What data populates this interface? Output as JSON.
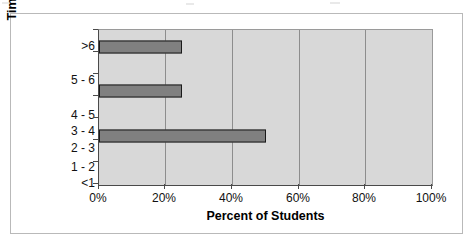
{
  "chart_data": {
    "type": "bar",
    "orientation": "horizontal",
    "title": "",
    "xlabel": "Percent of Students",
    "ylabel": "Time to Perform (hrs)",
    "categories": [
      "<1",
      "1 - 2",
      "2 - 3",
      "3 - 4",
      "4 - 5",
      "5 - 6",
      ">6"
    ],
    "values": [
      0,
      0,
      50,
      0,
      25,
      0,
      25
    ],
    "xlim": [
      0,
      100
    ],
    "xticks": [
      0,
      20,
      40,
      60,
      80,
      100
    ],
    "xticklabels": [
      "0%",
      "20%",
      "40%",
      "60%",
      "80%",
      "100%"
    ],
    "grid": "vertical",
    "legend": "none",
    "bar_color": "#808080",
    "bar_edge_color": "#1a1a1a",
    "plot_background": "#d8d8d8",
    "figure_background": "#ffffff"
  }
}
